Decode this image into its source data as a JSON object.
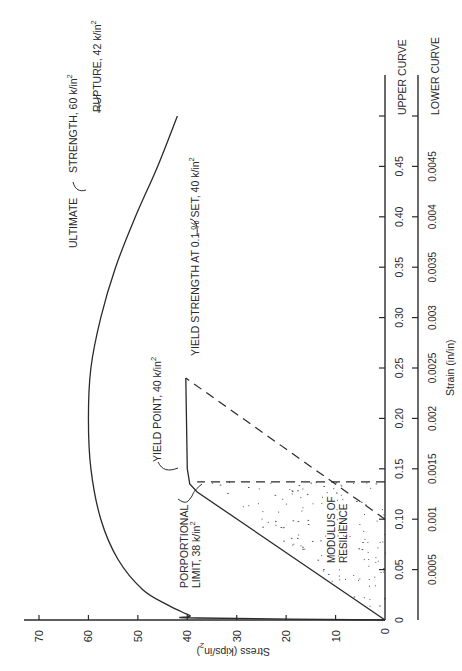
{
  "chart_data": {
    "type": "line",
    "title": "",
    "orientation_note": "figure printed rotated 90 degrees counter-clockwise",
    "xlabel": "Strain (in/in)",
    "ylabel": "Stress (kips/in²)",
    "ylim": [
      0,
      70
    ],
    "y_ticks": [
      0,
      10,
      20,
      30,
      40,
      50,
      60,
      70
    ],
    "y_tick_labels": [
      "0",
      "10",
      "20",
      "30",
      "40",
      "50",
      "60",
      "70"
    ],
    "x_axes": [
      {
        "name": "UPPER CURVE",
        "xlim": [
          0,
          0.5
        ],
        "ticks": [
          0,
          0.05,
          0.1,
          0.15,
          0.2,
          0.25,
          0.3,
          0.35,
          0.4,
          0.45,
          0.5
        ],
        "tick_labels": [
          "0",
          "0.05",
          "0.10",
          "0.15",
          "0.20",
          "0.25",
          "0.30",
          "0.35",
          "0.40",
          "0.45",
          ""
        ]
      },
      {
        "name": "LOWER CURVE",
        "xlim": [
          0,
          0.005
        ],
        "ticks": [
          0,
          0.0005,
          0.001,
          0.0015,
          0.002,
          0.0025,
          0.003,
          0.0035,
          0.004,
          0.0045,
          0.005
        ],
        "tick_labels": [
          "",
          "0.0005",
          "0.001",
          "0.0015",
          "0.002",
          "0.0025",
          "0.003",
          "0.0035",
          "0.004",
          "0.0045",
          ""
        ]
      }
    ],
    "series": [
      {
        "name": "Upper curve (full test, upper strain scale)",
        "points": [
          [
            0,
            0
          ],
          [
            0.002,
            38
          ],
          [
            0.003,
            40
          ],
          [
            0.004,
            39.4
          ],
          [
            0.006,
            40.2
          ],
          [
            0.015,
            44
          ],
          [
            0.03,
            49
          ],
          [
            0.06,
            54
          ],
          [
            0.1,
            57.5
          ],
          [
            0.15,
            59.5
          ],
          [
            0.2,
            60
          ],
          [
            0.25,
            59.5
          ],
          [
            0.3,
            57.5
          ],
          [
            0.35,
            54.5
          ],
          [
            0.4,
            50.5
          ],
          [
            0.45,
            46
          ],
          [
            0.5,
            42
          ]
        ]
      },
      {
        "name": "Lower curve (elastic region, lower strain scale)",
        "points": [
          [
            0,
            0
          ],
          [
            0.00127,
            38
          ],
          [
            0.00135,
            39.5
          ],
          [
            0.0015,
            40
          ],
          [
            0.0024,
            40.3
          ]
        ]
      },
      {
        "name": "0.1% offset line (dashed, lower scale)",
        "points": [
          [
            0.001,
            0
          ],
          [
            0.0024,
            40.3
          ]
        ]
      },
      {
        "name": "Proportional limit strain marker (dashed vertical)",
        "points": [
          [
            0.00137,
            0
          ],
          [
            0.00137,
            38
          ]
        ]
      }
    ],
    "annotations": [
      {
        "text": "ULTIMATE STRENGTH, 60 k/in²",
        "at": [
          0.2,
          60
        ],
        "axis": "upper"
      },
      {
        "text": "RUPTURE, 42 k/in²",
        "at": [
          0.5,
          42
        ],
        "axis": "upper"
      },
      {
        "text": "YIELD POINT, 40 k/in²",
        "at": [
          0.0013,
          39.5
        ],
        "axis": "lower"
      },
      {
        "text": "YIELD STRENGTH AT 0.1% SET, 40 k/in²",
        "at": [
          0.0024,
          40
        ],
        "axis": "lower"
      },
      {
        "text": "PORPORTIONAL LIMIT, 38 k/in²",
        "at": [
          0.00127,
          38
        ],
        "axis": "lower"
      },
      {
        "text": "MODULUS OF RESILIENCE",
        "region": "shaded triangle under elastic line"
      }
    ],
    "grid": false,
    "legend": "none"
  },
  "labels": {
    "ultimate_1": "ULTIMATE",
    "ultimate_2": "STRENGTH,  60  k/in",
    "rupture": "RUPTURE,  42  k/in",
    "yield_point": "YIELD  POINT,  40  k/in",
    "yield_strength": "YIELD  STRENGTH  AT  0.1 %  SET,  40  k/in",
    "prop_1": "PORPORTIONAL",
    "prop_2": "LIMIT,  38  k/in",
    "mod_1": "MODULUS  OF",
    "mod_2": "RESILIENCE",
    "sup": "2",
    "upper_curve": "UPPER  CURVE",
    "lower_curve": "LOWER  CURVE",
    "x_title": "Strain  (in/in)",
    "y_title": "Stress (kips/in",
    "y_title_close": ")"
  }
}
